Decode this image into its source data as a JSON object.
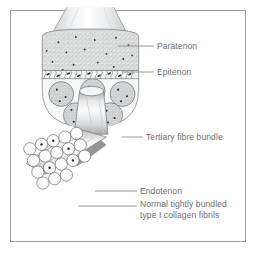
{
  "figure": {
    "kind": "anatomical-illustration",
    "frame_border_color": "#9a9a9a",
    "background_color": "#ffffff",
    "label_color": "#6e6e6e",
    "leader_line_color": "#8c8c8c",
    "outline_color": "#6b6b6b"
  },
  "labels": [
    {
      "id": "paratenon",
      "text": "Paratenon",
      "x": 157,
      "y": 41,
      "leader": {
        "x1": 118,
        "y1": 46,
        "x2": 154,
        "y2": 46
      }
    },
    {
      "id": "epitenon",
      "text": "Epitenon",
      "x": 157,
      "y": 67,
      "leader": {
        "x1": 122,
        "y1": 72,
        "x2": 154,
        "y2": 72
      }
    },
    {
      "id": "tertiary",
      "text": "Tertiary fibre bundle",
      "x": 146,
      "y": 132,
      "leader": {
        "x1": 122,
        "y1": 137,
        "x2": 143,
        "y2": 137
      }
    },
    {
      "id": "endotenon",
      "text": "Endotenon",
      "x": 140,
      "y": 186,
      "leader": {
        "x1": 95,
        "y1": 191,
        "x2": 137,
        "y2": 191
      }
    },
    {
      "id": "fibrils",
      "text": "Normal tightly bundled type I collagen fibrils",
      "x": 140,
      "y": 200,
      "leader": {
        "x1": 78,
        "y1": 206,
        "x2": 137,
        "y2": 206
      }
    }
  ],
  "structures": {
    "sheath_label": "tendon sheath cylinder",
    "epitenon_label": "stippled epitenon dome",
    "crimp_band_label": "crimped collagen band with tenocyte nuclei",
    "bundles_label": "tertiary fibre bundles in cross-section",
    "extruded_bundle_label": "extruded tertiary fibre bundle",
    "fibril_cluster_label": "collagen fibril cluster cross-section",
    "fibril_tubes_label": "collagen fibril tubes"
  }
}
